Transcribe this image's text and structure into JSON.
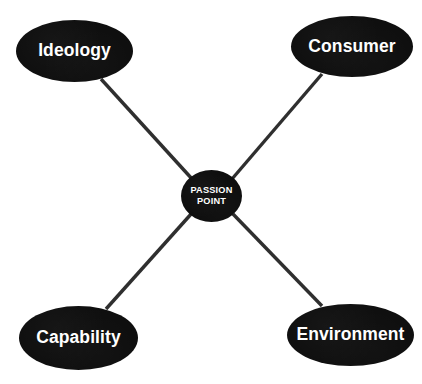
{
  "diagram": {
    "type": "hub-and-spoke",
    "background_color": "#ffffff",
    "node_fill_color": "#0e0e0e",
    "node_text_color": "#ffffff",
    "connector_color": "#2f2f2f",
    "connector_width_px": 3.4,
    "center": {
      "id": "passion-point",
      "label_line1": "PASSION",
      "label_line2": "POINT",
      "shape": "circle",
      "cx": 211.5,
      "cy": 196,
      "rx": 30.5,
      "ry": 26
    },
    "nodes": [
      {
        "id": "ideology",
        "label": "Ideology",
        "shape": "ellipse",
        "position": "top-left",
        "cx": 74.5,
        "cy": 51,
        "rx": 58.5,
        "ry": 31
      },
      {
        "id": "consumer",
        "label": "Consumer",
        "shape": "ellipse",
        "position": "top-right",
        "cx": 352,
        "cy": 46.5,
        "rx": 61,
        "ry": 30.5
      },
      {
        "id": "capability",
        "label": "Capability",
        "shape": "ellipse",
        "position": "bottom-left",
        "cx": 78.5,
        "cy": 338,
        "rx": 59.5,
        "ry": 32
      },
      {
        "id": "environment",
        "label": "Environment",
        "shape": "ellipse",
        "position": "bottom-right",
        "cx": 350.5,
        "cy": 335,
        "rx": 63.5,
        "ry": 31
      }
    ],
    "connectors": [
      {
        "id": "ideology-to-center",
        "from": "ideology",
        "to": "passion-point",
        "x1": 101,
        "y1": 79,
        "x2": 193,
        "y2": 180
      },
      {
        "id": "consumer-to-center",
        "from": "consumer",
        "to": "passion-point",
        "x1": 322,
        "y1": 74,
        "x2": 232,
        "y2": 179
      },
      {
        "id": "capability-to-center",
        "from": "capability",
        "to": "passion-point",
        "x1": 106,
        "y1": 309,
        "x2": 192,
        "y2": 213
      },
      {
        "id": "environment-to-center",
        "from": "environment",
        "to": "passion-point",
        "x1": 322,
        "y1": 306,
        "x2": 233,
        "y2": 214
      }
    ]
  }
}
